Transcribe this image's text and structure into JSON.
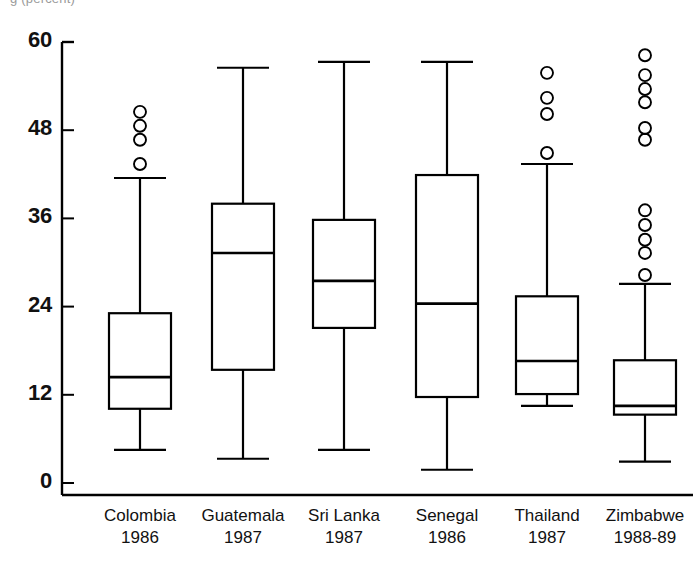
{
  "top_fragment": "g (percent)",
  "chart_data": {
    "type": "box",
    "title": "",
    "xlabel": "",
    "ylabel": "",
    "ylim": [
      0,
      60
    ],
    "yticks": [
      0,
      12,
      24,
      36,
      48,
      60
    ],
    "ytick_labels": [
      "0",
      "12",
      "24",
      "36",
      "48",
      "60"
    ],
    "grid": false,
    "legend": "none",
    "categories": [
      "Colombia\n1986",
      "Guatemala\n1987",
      "Sri Lanka\n1987",
      "Senegal\n1986",
      "Thailand\n1987",
      "Zimbabwe\n1988-89"
    ],
    "boxes": [
      {
        "name": "Colombia",
        "year": "1986",
        "whisker_low": 4.5,
        "q1": 10.1,
        "median": 14.4,
        "q3": 23.1,
        "whisker_high": 41.5,
        "outliers": [
          43.4,
          46.7,
          48.6,
          50.5
        ]
      },
      {
        "name": "Guatemala",
        "year": "1987",
        "whisker_low": 3.3,
        "q1": 15.4,
        "median": 31.3,
        "q3": 38.0,
        "whisker_high": 56.5,
        "outliers": []
      },
      {
        "name": "Sri Lanka",
        "year": "1987",
        "whisker_low": 4.5,
        "q1": 21.1,
        "median": 27.5,
        "q3": 35.8,
        "whisker_high": 57.3,
        "outliers": []
      },
      {
        "name": "Senegal",
        "year": "1986",
        "whisker_low": 1.8,
        "q1": 11.7,
        "median": 24.4,
        "q3": 41.9,
        "whisker_high": 57.3,
        "outliers": []
      },
      {
        "name": "Thailand",
        "year": "1987",
        "whisker_low": 10.5,
        "q1": 12.1,
        "median": 16.6,
        "q3": 25.4,
        "whisker_high": 43.4,
        "outliers": [
          44.9,
          50.2,
          52.4,
          55.8
        ]
      },
      {
        "name": "Zimbabwe",
        "year": "1988-89",
        "whisker_low": 2.9,
        "q1": 9.3,
        "median": 10.5,
        "q3": 16.7,
        "whisker_high": 27.1,
        "outliers": [
          28.3,
          31.3,
          33.1,
          35.1,
          37.1,
          46.7,
          48.3,
          51.8,
          53.6,
          55.5,
          58.2
        ]
      }
    ]
  },
  "style": {
    "line_color": "#000000",
    "background": "#ffffff",
    "text_color": "#111111"
  }
}
